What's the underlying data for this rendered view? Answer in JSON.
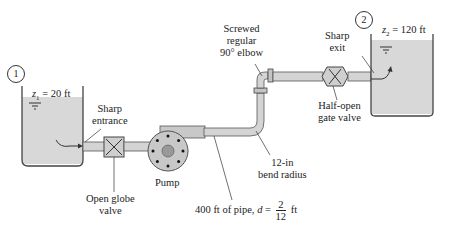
{
  "diagram": {
    "colors": {
      "pipe_fill": "#d4d4d4",
      "pipe_stroke": "#555555",
      "water_fill": "#d8d8d8",
      "tank_stroke": "#444444",
      "pump_fill": "#c8c8c8",
      "leader_line": "#333333"
    },
    "reservoir_1": {
      "marker": "1",
      "elevation_var": "z",
      "elevation_sub": "1",
      "elevation_value": " = 20 ft"
    },
    "reservoir_2": {
      "marker": "2",
      "elevation_var": "z",
      "elevation_sub": "2",
      "elevation_value": " = 120 ft"
    },
    "labels": {
      "sharp_entrance_1": "Sharp",
      "sharp_entrance_2": "entrance",
      "open_globe_valve_1": "Open globe",
      "open_globe_valve_2": "valve",
      "pump": "Pump",
      "elbow_1": "Screwed",
      "elbow_2": "regular",
      "elbow_3": "90° elbow",
      "sharp_exit_1": "Sharp",
      "sharp_exit_2": "exit",
      "gate_valve_1": "Half-open",
      "gate_valve_2": "gate valve",
      "bend_1": "12-in",
      "bend_2": "bend radius",
      "pipe_prefix": "400 ft of pipe, ",
      "pipe_d": "d",
      "pipe_eq": " = ",
      "pipe_num": "2",
      "pipe_den": "12",
      "pipe_unit": " ft"
    }
  }
}
